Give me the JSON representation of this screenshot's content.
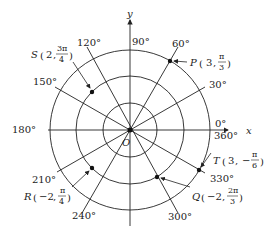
{
  "diagram": {
    "type": "polar-coordinate-grid",
    "center": {
      "x": 130,
      "y": 130
    },
    "unit_px": 26.7,
    "circle_radii": [
      1,
      2,
      3
    ],
    "axes": {
      "x_label": "x",
      "y_label": "y",
      "origin_label": "O"
    },
    "angle_labels": {
      "a0": "0°",
      "a360": "360°",
      "a30": "30°",
      "a60": "60°",
      "a90": "90°",
      "a120": "120°",
      "a150": "150°",
      "a180": "180°",
      "a210": "210°",
      "a240": "240°",
      "a300": "300°",
      "a330": "330°"
    },
    "points": [
      {
        "name": "P",
        "r": "3",
        "theta": "π/3",
        "theta_num": "π",
        "theta_den": "3",
        "sign": ""
      },
      {
        "name": "Q",
        "r": "−2",
        "theta": "2π/3",
        "theta_num": "2π",
        "theta_den": "3",
        "sign": ""
      },
      {
        "name": "R",
        "r": "−2",
        "theta": "π/4",
        "theta_num": "π",
        "theta_den": "4",
        "sign": ""
      },
      {
        "name": "S",
        "r": "2",
        "theta": "3π/4",
        "theta_num": "3π",
        "theta_den": "4",
        "sign": ""
      },
      {
        "name": "T",
        "r": "3",
        "theta": "−π/6",
        "theta_num": "π",
        "theta_den": "6",
        "sign": "−"
      }
    ],
    "colors": {
      "line": "#222222",
      "background": "#ffffff"
    }
  }
}
